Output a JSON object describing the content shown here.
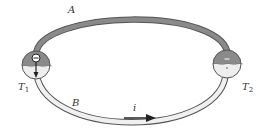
{
  "diagram": {
    "wire_a": {
      "label": "A",
      "color": "#8a8a8a"
    },
    "wire_b": {
      "label": "B",
      "color": "#f0f0f0"
    },
    "junction_1": {
      "label": "T",
      "subscript": "1"
    },
    "junction_2": {
      "label": "T",
      "subscript": "2"
    },
    "current": {
      "label": "i",
      "direction": "right"
    },
    "colors": {
      "outline": "#555555",
      "dark_fill": "#8a8a8a",
      "light_fill": "#eeeeee",
      "arrow": "#222222"
    }
  }
}
